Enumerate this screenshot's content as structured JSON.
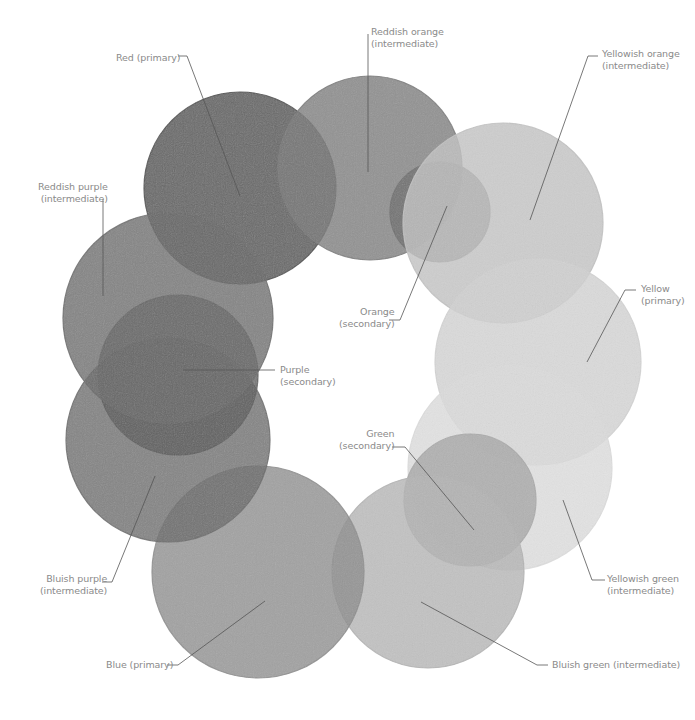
{
  "diagram": {
    "title": "",
    "type": "color-wheel",
    "circles": [
      {
        "id": "red",
        "name": "Red",
        "category": "primary",
        "cx": 240,
        "cy": 188,
        "r": 96,
        "fill": "#4a4a4a"
      },
      {
        "id": "reddish-orange",
        "name": "Reddish orange",
        "category": "intermediate",
        "cx": 370,
        "cy": 168,
        "r": 92,
        "fill": "#7a7a7a"
      },
      {
        "id": "orange",
        "name": "Orange",
        "category": "secondary",
        "cx": 440,
        "cy": 212,
        "r": 50,
        "fill": "#6f6f6f"
      },
      {
        "id": "yellowish-orange",
        "name": "Yellowish orange",
        "category": "intermediate",
        "cx": 503,
        "cy": 223,
        "r": 100,
        "fill": "#c2c2c2"
      },
      {
        "id": "yellow",
        "name": "Yellow",
        "category": "primary",
        "cx": 538,
        "cy": 362,
        "r": 103,
        "fill": "#d2d2d2"
      },
      {
        "id": "yellowish-green",
        "name": "Yellowish green",
        "category": "intermediate",
        "cx": 510,
        "cy": 468,
        "r": 102,
        "fill": "#dcdcdc"
      },
      {
        "id": "green",
        "name": "Green",
        "category": "secondary",
        "cx": 470,
        "cy": 500,
        "r": 66,
        "fill": "#a8a8a8"
      },
      {
        "id": "bluish-green",
        "name": "Bluish green",
        "category": "intermediate",
        "cx": 428,
        "cy": 572,
        "r": 96,
        "fill": "#b4b4b4"
      },
      {
        "id": "blue",
        "name": "Blue",
        "category": "primary",
        "cx": 258,
        "cy": 572,
        "r": 106,
        "fill": "#8e8e8e"
      },
      {
        "id": "bluish-purple",
        "name": "Bluish purple",
        "category": "intermediate",
        "cx": 168,
        "cy": 440,
        "r": 102,
        "fill": "#6a6a6a"
      },
      {
        "id": "purple",
        "name": "Purple",
        "category": "secondary",
        "cx": 178,
        "cy": 375,
        "r": 80,
        "fill": "#5c5c5c"
      },
      {
        "id": "reddish-purple",
        "name": "Reddish purple",
        "category": "intermediate",
        "cx": 168,
        "cy": 318,
        "r": 105,
        "fill": "#6a6a6a"
      }
    ],
    "labels": [
      {
        "id": "red",
        "line1": "Red (primary)",
        "line2": "",
        "x": 116,
        "y": 52,
        "align": "right"
      },
      {
        "id": "reddish-orange",
        "line1": "Reddish orange",
        "line2": "(intermediate)",
        "x": 371,
        "y": 26,
        "align": "left"
      },
      {
        "id": "yellowish-orange",
        "line1": "Yellowish orange",
        "line2": "(intermediate)",
        "x": 602,
        "y": 48,
        "align": "left"
      },
      {
        "id": "reddish-purple",
        "line1": "Reddish purple",
        "line2": "(intermediate)",
        "x": 38,
        "y": 181,
        "align": "right"
      },
      {
        "id": "orange",
        "line1": "Orange",
        "line2": "(secondary)",
        "x": 339,
        "y": 306,
        "align": "right"
      },
      {
        "id": "yellow",
        "line1": "Yellow",
        "line2": "(primary)",
        "x": 641,
        "y": 283,
        "align": "left"
      },
      {
        "id": "purple",
        "line1": "Purple",
        "line2": "(secondary)",
        "x": 280,
        "y": 364,
        "align": "left"
      },
      {
        "id": "green",
        "line1": "Green",
        "line2": "(secondary)",
        "x": 339,
        "y": 428,
        "align": "right"
      },
      {
        "id": "bluish-purple",
        "line1": "Bluish purple",
        "line2": "(intermediate)",
        "x": 40,
        "y": 573,
        "align": "right"
      },
      {
        "id": "yellowish-green",
        "line1": "Yellowish green",
        "line2": "(intermediate)",
        "x": 607,
        "y": 573,
        "align": "left"
      },
      {
        "id": "blue",
        "line1": "Blue (primary)",
        "line2": "",
        "x": 106,
        "y": 659,
        "align": "right"
      },
      {
        "id": "bluish-green",
        "line1": "Bluish green (intermediate)",
        "line2": "",
        "x": 552,
        "y": 659,
        "align": "left"
      }
    ],
    "leaders": [
      {
        "id": "red",
        "points": [
          [
            178,
            56
          ],
          [
            187,
            56
          ],
          [
            240,
            196
          ]
        ]
      },
      {
        "id": "reddish-orange",
        "points": [
          [
            368,
            34
          ],
          [
            368,
            172
          ]
        ]
      },
      {
        "id": "yellowish-orange",
        "points": [
          [
            598,
            56
          ],
          [
            588,
            56
          ],
          [
            530,
            220
          ]
        ]
      },
      {
        "id": "reddish-purple",
        "points": [
          [
            103,
            199
          ],
          [
            103,
            296
          ]
        ]
      },
      {
        "id": "orange",
        "points": [
          [
            389,
            320
          ],
          [
            400,
            320
          ],
          [
            447,
            206
          ]
        ]
      },
      {
        "id": "yellow",
        "points": [
          [
            636,
            290
          ],
          [
            625,
            290
          ],
          [
            587,
            362
          ]
        ]
      },
      {
        "id": "purple",
        "points": [
          [
            275,
            370
          ],
          [
            183,
            370
          ]
        ]
      },
      {
        "id": "green",
        "points": [
          [
            392,
            447
          ],
          [
            405,
            447
          ],
          [
            474,
            530
          ]
        ]
      },
      {
        "id": "bluish-purple",
        "points": [
          [
            102,
            582
          ],
          [
            112,
            582
          ],
          [
            155,
            476
          ]
        ]
      },
      {
        "id": "yellowish-green",
        "points": [
          [
            605,
            580
          ],
          [
            592,
            580
          ],
          [
            563,
            500
          ]
        ]
      },
      {
        "id": "blue",
        "points": [
          [
            167,
            665
          ],
          [
            178,
            665
          ],
          [
            265,
            601
          ]
        ]
      },
      {
        "id": "bluish-green",
        "points": [
          [
            548,
            665
          ],
          [
            537,
            665
          ],
          [
            421,
            602
          ]
        ]
      }
    ],
    "leader_color": "#555555"
  }
}
